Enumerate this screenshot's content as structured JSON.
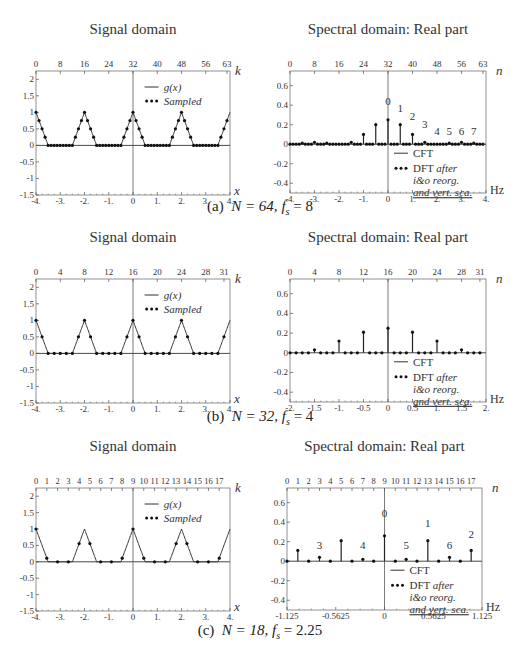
{
  "figure": {
    "rows": [
      {
        "id": "a",
        "caption_label": "(a)",
        "caption_N": "N = 64,",
        "caption_fs": "= 8",
        "N": 64,
        "fs": 8
      },
      {
        "id": "b",
        "caption_label": "(b)",
        "caption_N": "N = 32,",
        "caption_fs": "= 4",
        "N": 32,
        "fs": 4
      },
      {
        "id": "c",
        "caption_label": "(c)",
        "caption_N": "N = 18,",
        "caption_fs": "= 2.25",
        "N": 18,
        "fs": 2.25
      }
    ]
  },
  "chart_data": [
    {
      "id": "a-signal",
      "type": "line",
      "title": "Signal domain",
      "xlabel": "x",
      "top_axis_label": "k",
      "xlim": [
        -4,
        4
      ],
      "ylim": [
        -1.5,
        2.25
      ],
      "x_ticks": [
        "-4.",
        "-3.",
        "-2.",
        "-1.",
        "0",
        "1.",
        "2.",
        "3.",
        "4."
      ],
      "y_ticks": [
        "2",
        "1.5",
        "1",
        "0.5",
        "0",
        "-0.5",
        "-1",
        "-1.5"
      ],
      "top_ticks": [
        "0",
        "8",
        "16",
        "24",
        "32",
        "40",
        "48",
        "56",
        "63"
      ],
      "legend": [
        "g(x)",
        "Sampled"
      ],
      "series": [
        {
          "name": "g(x)",
          "description": "periodic triangle pulses, period 2, peak 1 at x=-4,-2,0,2,4, half-width 0.5"
        },
        {
          "name": "Sampled",
          "samples": 64,
          "spacing": 0.125
        }
      ]
    },
    {
      "id": "a-spectral",
      "type": "bar",
      "title": "Spectral domain: Real part",
      "xlabel": "Hz",
      "top_axis_label": "n",
      "xlim": [
        -4,
        4
      ],
      "ylim": [
        -0.5,
        0.75
      ],
      "x_ticks": [
        "-4.",
        "-3.",
        "-2.",
        "-1.",
        "0",
        "1.",
        "2.",
        "3.",
        "4."
      ],
      "y_ticks": [
        "0.6",
        "0.4",
        "0.2",
        "0",
        "-0.2",
        "-0.4"
      ],
      "top_ticks": [
        "0",
        "8",
        "16",
        "24",
        "32",
        "40",
        "48",
        "56",
        "63"
      ],
      "legend": [
        "CFT",
        "DFT after i&o reorg. and vert. sca."
      ],
      "x": [
        -3.5,
        -3.0,
        -2.5,
        -1.5,
        -1.0,
        -0.5,
        0,
        0.5,
        1.0,
        1.5,
        2.5,
        3.0,
        3.5
      ],
      "values": [
        0.01,
        0.02,
        0.01,
        0.02,
        0.1,
        0.2,
        0.25,
        0.2,
        0.1,
        0.02,
        0.01,
        0.02,
        0.01
      ],
      "annotations": [
        {
          "text": "0",
          "x": 0,
          "y": 0.4
        },
        {
          "text": "1",
          "x": 0.5,
          "y": 0.33
        },
        {
          "text": "2",
          "x": 1.0,
          "y": 0.25
        },
        {
          "text": "3",
          "x": 1.5,
          "y": 0.17
        },
        {
          "text": "4",
          "x": 2.0,
          "y": 0.09
        },
        {
          "text": "5",
          "x": 2.5,
          "y": 0.09
        },
        {
          "text": "6",
          "x": 3.0,
          "y": 0.09
        },
        {
          "text": "7",
          "x": 3.5,
          "y": 0.09
        }
      ]
    },
    {
      "id": "b-signal",
      "type": "line",
      "title": "Signal domain",
      "xlabel": "x",
      "top_axis_label": "k",
      "xlim": [
        -4,
        4
      ],
      "ylim": [
        -1.5,
        2.25
      ],
      "x_ticks": [
        "-4.",
        "-3.",
        "-2.",
        "-1.",
        "0",
        "1.",
        "2.",
        "3.",
        "4."
      ],
      "y_ticks": [
        "2",
        "1.5",
        "1",
        "0.5",
        "0",
        "-0.5",
        "-1",
        "-1.5"
      ],
      "top_ticks": [
        "0",
        "4",
        "8",
        "12",
        "16",
        "20",
        "24",
        "28",
        "31"
      ],
      "legend": [
        "g(x)",
        "Sampled"
      ],
      "series": [
        {
          "name": "g(x)",
          "description": "periodic triangle pulses, period 2, peak 1"
        },
        {
          "name": "Sampled",
          "samples": 32,
          "spacing": 0.25
        }
      ]
    },
    {
      "id": "b-spectral",
      "type": "bar",
      "title": "Spectral domain: Real part",
      "xlabel": "Hz",
      "top_axis_label": "n",
      "xlim": [
        -2,
        2
      ],
      "ylim": [
        -0.5,
        0.75
      ],
      "x_ticks": [
        "-2.",
        "-1.5",
        "-1.",
        "-0.5",
        "0",
        "0.5",
        "1.",
        "1.5",
        "2."
      ],
      "y_ticks": [
        "0.6",
        "0.4",
        "0.2",
        "0",
        "-0.2",
        "-0.4"
      ],
      "top_ticks": [
        "0",
        "4",
        "8",
        "12",
        "16",
        "20",
        "24",
        "28",
        "31"
      ],
      "legend": [
        "CFT",
        "DFT after i&o reorg. and vert. sca."
      ],
      "x": [
        -1.5,
        -1.0,
        -0.5,
        0,
        0.5,
        1.0,
        1.5
      ],
      "values": [
        0.03,
        0.12,
        0.21,
        0.25,
        0.21,
        0.12,
        0.03
      ]
    },
    {
      "id": "c-signal",
      "type": "line",
      "title": "Signal domain",
      "xlabel": "x",
      "top_axis_label": "k",
      "xlim": [
        -4,
        4
      ],
      "ylim": [
        -1.5,
        2.25
      ],
      "x_ticks": [
        "-4.",
        "-3.",
        "-2.",
        "-1.",
        "0",
        "1.",
        "2.",
        "3.",
        "4."
      ],
      "y_ticks": [
        "2",
        "1.5",
        "1",
        "0.5",
        "0",
        "-0.5",
        "-1",
        "-1.5"
      ],
      "top_ticks": [
        "0",
        "1",
        "2",
        "3",
        "4",
        "5",
        "6",
        "7",
        "8",
        "9",
        "10",
        "11",
        "12",
        "13",
        "14",
        "15",
        "16",
        "17"
      ],
      "legend": [
        "g(x)",
        "Sampled"
      ],
      "series": [
        {
          "name": "g(x)",
          "description": "periodic triangle pulses, period 2, peak 1"
        },
        {
          "name": "Sampled",
          "samples": 18,
          "spacing": 0.4444
        }
      ]
    },
    {
      "id": "c-spectral",
      "type": "bar",
      "title": "Spectral domain: Real part",
      "xlabel": "Hz",
      "top_axis_label": "n",
      "xlim": [
        -1.125,
        1.125
      ],
      "ylim": [
        -0.5,
        0.75
      ],
      "x_ticks": [
        "-1.125",
        "-0.5625",
        "0",
        "0.5625",
        "1.125"
      ],
      "y_ticks": [
        "0.6",
        "0.4",
        "0.2",
        "0",
        "-0.2",
        "-0.4"
      ],
      "top_ticks": [
        "0",
        "1",
        "2",
        "3",
        "4",
        "5",
        "6",
        "7",
        "8",
        "9",
        "10",
        "11",
        "12",
        "13",
        "14",
        "15",
        "16",
        "17"
      ],
      "legend": [
        "CFT",
        "DFT after i&o reorg. and vert. sca."
      ],
      "x": [
        -1.0,
        -0.75,
        -0.5,
        -0.25,
        0,
        0.25,
        0.5,
        0.75,
        1.0
      ],
      "values": [
        0.11,
        0.04,
        0.21,
        0.02,
        0.26,
        0.02,
        0.21,
        0.04,
        0.11
      ],
      "annotations": [
        {
          "text": "0",
          "x": 0,
          "y": 0.45
        },
        {
          "text": "1",
          "x": 0.5,
          "y": 0.35
        },
        {
          "text": "2",
          "x": 1.0,
          "y": 0.24
        },
        {
          "text": "3",
          "x": -0.75,
          "y": 0.13
        },
        {
          "text": "4",
          "x": -0.25,
          "y": 0.13
        },
        {
          "text": "5",
          "x": 0.25,
          "y": 0.13
        },
        {
          "text": "6",
          "x": 0.75,
          "y": 0.13
        }
      ]
    }
  ]
}
